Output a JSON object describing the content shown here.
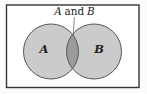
{
  "diagram": {
    "type": "venn",
    "title": {
      "var_a": "A",
      "conj": "and",
      "var_b": "B"
    },
    "sets": [
      {
        "label": "A"
      },
      {
        "label": "B"
      }
    ],
    "intersection_label_parts": "A and B",
    "colors": {
      "frame_stroke": "#343434",
      "interior_background": "#ffffff",
      "circle_fill": "#cbcbcb",
      "circle_stroke": "#565656",
      "intersection_fill": "#9b9b9b",
      "pointer_stroke": "#6a6a6a",
      "text": "#1c1c1c"
    }
  }
}
